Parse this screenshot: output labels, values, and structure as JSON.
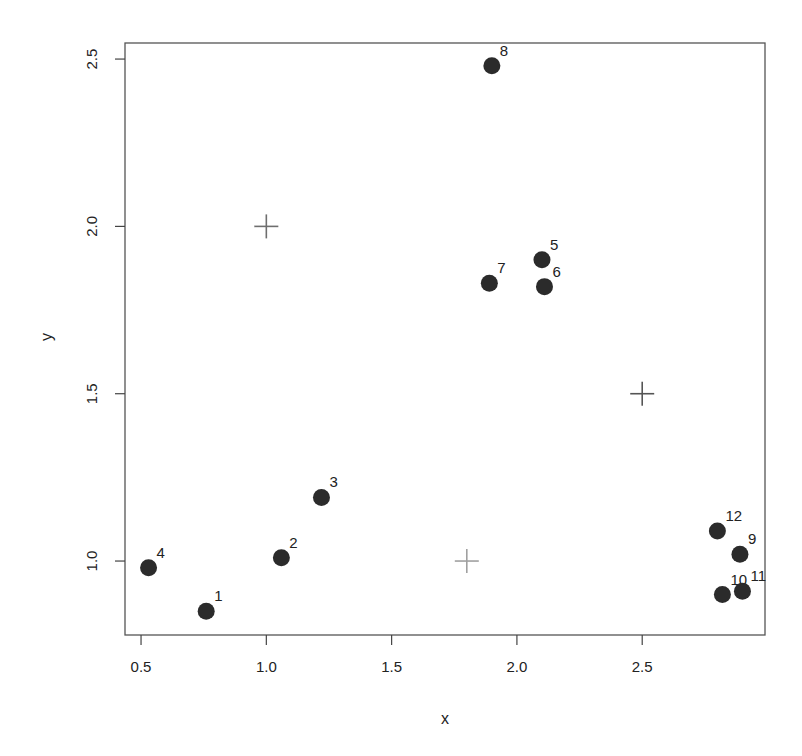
{
  "chart_data": {
    "type": "scatter",
    "title": "",
    "xlabel": "x",
    "ylabel": "y",
    "xlim": [
      0.436,
      2.99
    ],
    "ylim": [
      0.779,
      2.548
    ],
    "xticks": [
      0.5,
      1.0,
      1.5,
      2.0,
      2.5
    ],
    "xtick_labels": [
      "0.5",
      "1.0",
      "1.5",
      "2.0",
      "2.5"
    ],
    "yticks": [
      1.0,
      1.5,
      2.0,
      2.5
    ],
    "ytick_labels": [
      "1.0",
      "1.5",
      "2.0",
      "2.5"
    ],
    "grid": false,
    "legend": null,
    "series": [
      {
        "name": "points",
        "marker": "filled-circle",
        "color": "#2b2b2b",
        "points": [
          {
            "label": "1",
            "x": 0.76,
            "y": 0.85
          },
          {
            "label": "2",
            "x": 1.06,
            "y": 1.01
          },
          {
            "label": "3",
            "x": 1.22,
            "y": 1.19
          },
          {
            "label": "4",
            "x": 0.53,
            "y": 0.98
          },
          {
            "label": "5",
            "x": 2.1,
            "y": 1.9
          },
          {
            "label": "6",
            "x": 2.11,
            "y": 1.82
          },
          {
            "label": "7",
            "x": 1.89,
            "y": 1.83
          },
          {
            "label": "8",
            "x": 1.9,
            "y": 2.48
          },
          {
            "label": "9",
            "x": 2.89,
            "y": 1.02
          },
          {
            "label": "10",
            "x": 2.82,
            "y": 0.9
          },
          {
            "label": "11",
            "x": 2.9,
            "y": 0.91
          },
          {
            "label": "12",
            "x": 2.8,
            "y": 1.09
          }
        ]
      },
      {
        "name": "centers",
        "marker": "plus",
        "color": "#7a7a7a",
        "points": [
          {
            "x": 1.0,
            "y": 2.0,
            "color": "#6e6e6e"
          },
          {
            "x": 2.5,
            "y": 1.5,
            "color": "#555555"
          },
          {
            "x": 1.8,
            "y": 1.0,
            "color": "#a0a0a0"
          }
        ]
      }
    ]
  }
}
